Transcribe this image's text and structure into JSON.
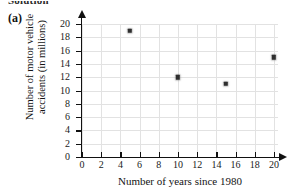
{
  "heading": {
    "text": "Solution"
  },
  "part_label": {
    "text": "(a)"
  },
  "chart_data": {
    "type": "scatter",
    "title": "",
    "xlabel": "Number of years since 1980",
    "ylabel": "Number of motor vehicle accidents (in millions)",
    "ylabel_line1": "Number of motor vehicle",
    "ylabel_line2": "accidents (in millions)",
    "xlim": [
      0,
      20
    ],
    "ylim": [
      0,
      20
    ],
    "xticks": [
      0,
      2,
      4,
      6,
      8,
      10,
      12,
      14,
      16,
      18,
      20
    ],
    "yticks": [
      0,
      2,
      4,
      6,
      8,
      10,
      12,
      14,
      16,
      18,
      20
    ],
    "grid": true,
    "legend": "none",
    "marker": "square",
    "marker_color": "#2e2e2e",
    "axis_color": "#111111",
    "grid_color": "#e2e2e2",
    "points": [
      {
        "x": 5,
        "y": 19
      },
      {
        "x": 10,
        "y": 12
      },
      {
        "x": 15,
        "y": 11
      },
      {
        "x": 20,
        "y": 15
      }
    ]
  }
}
